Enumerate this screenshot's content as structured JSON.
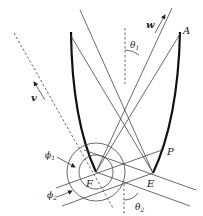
{
  "figure": {
    "type": "geometric optics / reflector diagram",
    "colors": {
      "line": "#444444",
      "curve": "#111111",
      "label": "#222222",
      "background": "#ffffff"
    },
    "labels": {
      "point_a": "A",
      "point_p": "P",
      "point_f": "F",
      "point_e": "E",
      "vector_w": "w",
      "vector_v": "v",
      "angle_theta1": "θ",
      "angle_theta1_sub": "1",
      "angle_theta2": "θ",
      "angle_theta2_sub": "2",
      "angle_phi1": "ϕ",
      "angle_phi1_sub": "1",
      "angle_phi2": "ϕ",
      "angle_phi2_sub": "2"
    }
  }
}
